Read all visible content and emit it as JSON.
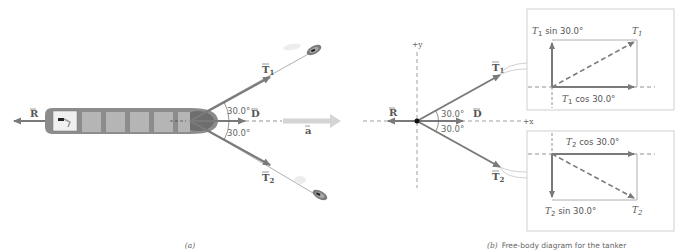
{
  "panel_a": {
    "caption": "(a)",
    "vectors": {
      "R": "R",
      "D": "D",
      "T1": "T",
      "T1_sub": "1",
      "T2": "T",
      "T2_sub": "2",
      "a": "a"
    },
    "angles": {
      "upper": "30.0°",
      "lower": "30.0°"
    }
  },
  "panel_b": {
    "caption_letter": "(b)",
    "caption_text": "Free-body diagram for the tanker",
    "axes": {
      "y": "+y",
      "x": "+x"
    },
    "vectors": {
      "R": "R",
      "D": "D",
      "T1": "T",
      "T1_sub": "1",
      "T2": "T",
      "T2_sub": "2"
    },
    "angles": {
      "upper": "30.0°",
      "lower": "30.0°"
    },
    "box_t1": {
      "sin_T": "T",
      "sin_sub": "1",
      "sin_text": " sin 30.0°",
      "cos_T": "T",
      "cos_sub": "1",
      "cos_text": " cos 30.0°",
      "res_T": "T",
      "res_sub": "1"
    },
    "box_t2": {
      "cos_T": "T",
      "cos_sub": "2",
      "cos_text": " cos 30.0°",
      "sin_T": "T",
      "sin_sub": "2",
      "sin_text": " sin 30.0°",
      "res_T": "T",
      "res_sub": "2"
    }
  },
  "colors": {
    "vector": "#7a7a7a",
    "hull": "#8c8c8c",
    "hold": "#b5b5b5",
    "bow": "#6e6e6e",
    "accel": "#d4d4d4",
    "box_border": "#cfcfcf",
    "text": "#555555"
  }
}
